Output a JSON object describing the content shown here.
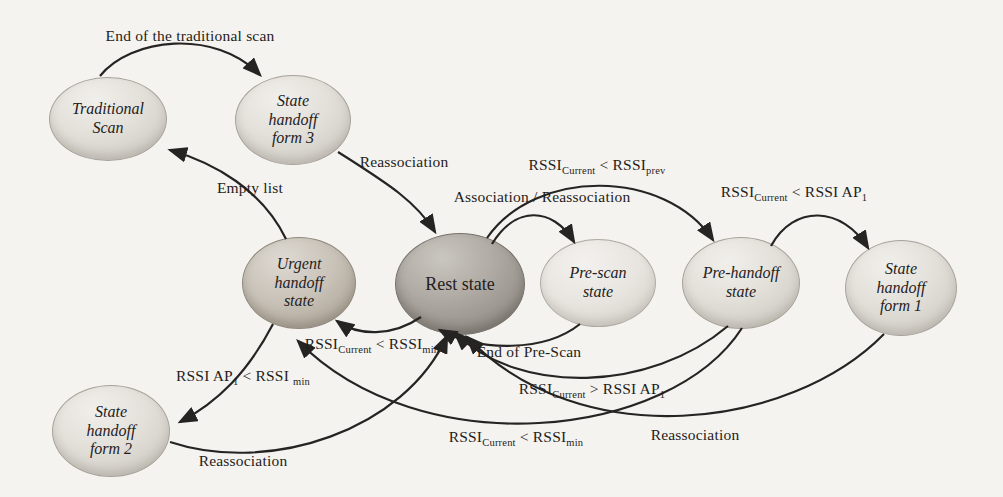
{
  "nodes": [
    {
      "id": "traditional-scan",
      "label": "Traditional\nScan"
    },
    {
      "id": "state-handoff-form-3",
      "label": "State\nhandoff\nform 3"
    },
    {
      "id": "urgent-handoff-state",
      "label": "Urgent\nhandoff\nstate"
    },
    {
      "id": "rest-state",
      "label": "Rest state"
    },
    {
      "id": "pre-scan-state",
      "label": "Pre-scan\nstate"
    },
    {
      "id": "pre-handoff-state",
      "label": "Pre-handoff\nstate"
    },
    {
      "id": "state-handoff-form-1",
      "label": "State\nhandoff\nform 1"
    },
    {
      "id": "state-handoff-form-2",
      "label": "State\nhandoff\nform 2"
    }
  ],
  "edges": [
    {
      "from": "traditional-scan",
      "to": "state-handoff-form-3",
      "text": "End of the traditional scan",
      "parts": [
        {
          "t": "End of the traditional scan"
        }
      ]
    },
    {
      "from": "state-handoff-form-3",
      "to": "rest-state",
      "text": "Reassociation",
      "parts": [
        {
          "t": "Reassociation"
        }
      ]
    },
    {
      "from": "urgent-handoff-state",
      "to": "traditional-scan",
      "text": "Empty list",
      "parts": [
        {
          "t": "Empty list"
        }
      ]
    },
    {
      "from": "rest-state",
      "to": "pre-scan-state",
      "text": "Association / Reassociation",
      "parts": [
        {
          "t": "Association / Reassociation"
        }
      ]
    },
    {
      "from": "rest-state",
      "to": "pre-handoff-state",
      "text": "RSSI_Current < RSSI_prev",
      "parts": [
        {
          "t": "RSSI"
        },
        {
          "sub": "Current"
        },
        {
          "t": " <  RSSI"
        },
        {
          "sub": "prev"
        }
      ]
    },
    {
      "from": "pre-handoff-state",
      "to": "state-handoff-form-1",
      "text": "RSSI_Current < RSSI AP_1",
      "parts": [
        {
          "t": "RSSI"
        },
        {
          "sub": "Current"
        },
        {
          "t": " < RSSI AP"
        },
        {
          "sub": "1"
        }
      ]
    },
    {
      "from": "rest-state",
      "to": "urgent-handoff-state",
      "text": "RSSI_Current < RSSI_min",
      "parts": [
        {
          "t": "RSSI"
        },
        {
          "sub": "Current"
        },
        {
          "t": " < RSSI"
        },
        {
          "sub": "min"
        }
      ]
    },
    {
      "from": "pre-scan-state",
      "to": "rest-state",
      "text": "End of Pre-Scan",
      "parts": [
        {
          "t": "End of Pre-Scan"
        }
      ]
    },
    {
      "from": "pre-handoff-state",
      "to": "rest-state",
      "text": "RSSI_Current > RSSI AP_1",
      "parts": [
        {
          "t": "RSSI"
        },
        {
          "sub": "Current"
        },
        {
          "t": " > RSSI AP"
        },
        {
          "sub": "1"
        }
      ]
    },
    {
      "from": "pre-handoff-state",
      "to": "urgent-handoff-state",
      "text": "RSSI_Current < RSSI_min",
      "parts": [
        {
          "t": "RSSI"
        },
        {
          "sub": "Current"
        },
        {
          "t": " < RSSI"
        },
        {
          "sub": "min"
        }
      ]
    },
    {
      "from": "urgent-handoff-state",
      "to": "state-handoff-form-2",
      "text": "RSSI AP_1 < RSSI_min",
      "parts": [
        {
          "t": "RSSI AP"
        },
        {
          "sub": "1"
        },
        {
          "t": " < RSSI "
        },
        {
          "sub": "min"
        }
      ]
    },
    {
      "from": "state-handoff-form-2",
      "to": "rest-state",
      "text": "Reassociation",
      "parts": [
        {
          "t": "Reassociation"
        }
      ]
    },
    {
      "from": "state-handoff-form-1",
      "to": "rest-state",
      "text": "Reassociation",
      "parts": [
        {
          "t": "Reassociation"
        }
      ]
    }
  ],
  "colors": {
    "background": "#f3f1ee",
    "node_light": "#ddd9d3",
    "node_rest_dark": "#918c85",
    "node_urgent_medium": "#b6afa4",
    "arrow": "#262422",
    "text": "#24211d"
  }
}
